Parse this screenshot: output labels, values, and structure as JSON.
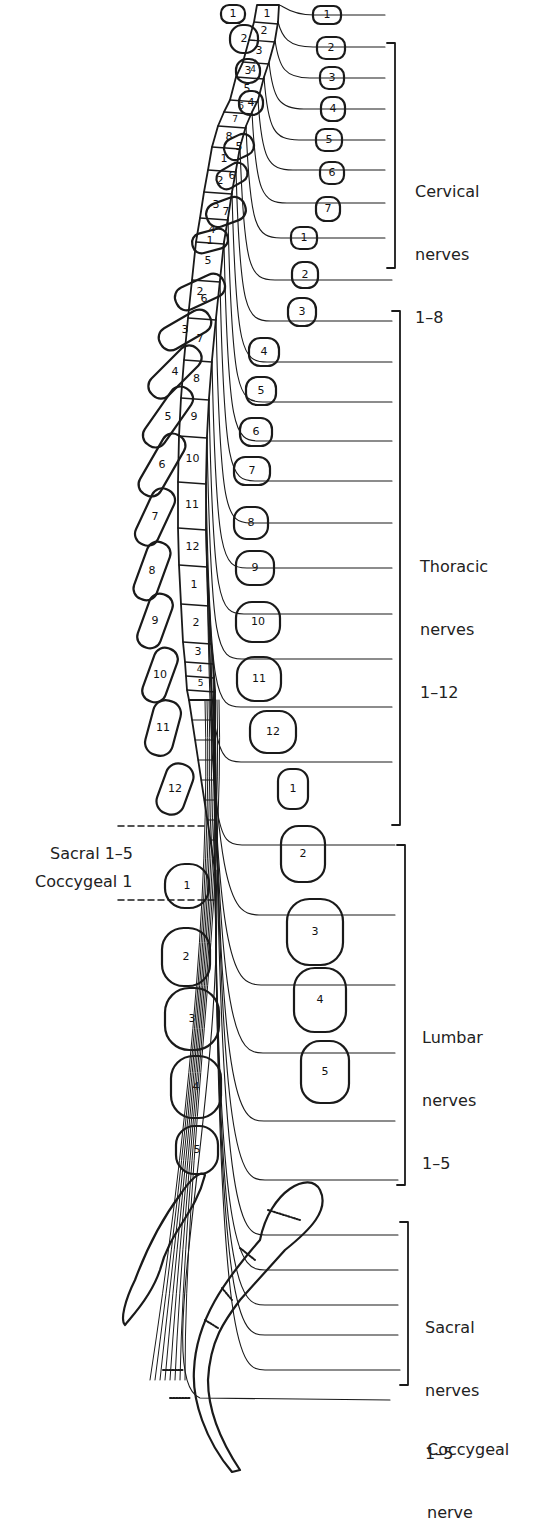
{
  "diagram": {
    "colors": {
      "ink": "#1a1a1a",
      "background": "#ffffff"
    },
    "cord_segments": {
      "cervical": [
        "1",
        "2",
        "3",
        "4",
        "5",
        "6",
        "7",
        "8"
      ],
      "thoracic": [
        "1",
        "2",
        "3",
        "4",
        "5",
        "6",
        "7",
        "8",
        "9",
        "10",
        "11",
        "12"
      ],
      "lumbar": [
        "1",
        "2",
        "3",
        "4",
        "5"
      ]
    },
    "vertebrae_right": {
      "cervical": [
        "1",
        "2",
        "3",
        "4",
        "5",
        "6",
        "7"
      ],
      "thoracic": [
        "1",
        "2",
        "3",
        "4",
        "5",
        "6",
        "7",
        "8",
        "9",
        "10",
        "11",
        "12"
      ],
      "lumbar": [
        "1",
        "2",
        "3",
        "4",
        "5"
      ]
    },
    "vertebrae_left_spinous": {
      "cervical": [
        "1",
        "2",
        "3",
        "4",
        "5",
        "6",
        "7"
      ],
      "thoracic": [
        "1",
        "2",
        "3",
        "4",
        "5",
        "6",
        "7",
        "8",
        "9",
        "10",
        "11",
        "12"
      ],
      "lumbar": [
        "1",
        "2",
        "3",
        "4",
        "5"
      ]
    },
    "groups": [
      {
        "name": "Cervical",
        "line1": "Cervical",
        "line2": "nerves",
        "line3": "1–8",
        "bracket_top": 43,
        "bracket_bottom": 268
      },
      {
        "name": "Thoracic",
        "line1": "Thoracic",
        "line2": "nerves",
        "line3": "1–12",
        "bracket_top": 311,
        "bracket_bottom": 825
      },
      {
        "name": "Lumbar",
        "line1": "Lumbar",
        "line2": "nerves",
        "line3": "1–5",
        "bracket_top": 845,
        "bracket_bottom": 1185
      },
      {
        "name": "Sacral",
        "line1": "Sacral",
        "line2": "nerves",
        "line3": "1–5",
        "bracket_top": 1222,
        "bracket_bottom": 1385
      }
    ],
    "coccygeal": {
      "line1": "Coccygeal",
      "line2": "nerve"
    },
    "left_labels": {
      "sacral": "Sacral 1–5",
      "coccygeal": "Coccygeal 1"
    }
  }
}
